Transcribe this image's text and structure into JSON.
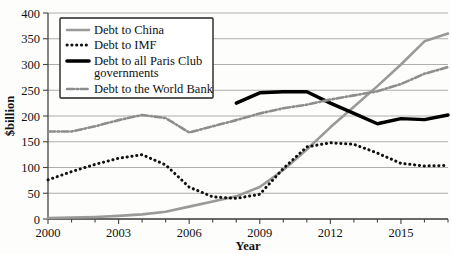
{
  "chart_data": {
    "type": "line",
    "title": "",
    "xlabel": "Year",
    "ylabel": "$billion",
    "xlim": [
      2000,
      2017
    ],
    "ylim": [
      0,
      400
    ],
    "grid": true,
    "legend_position": "top-left",
    "xticks": [
      "2000",
      "2003",
      "2006",
      "2009",
      "2012",
      "2015"
    ],
    "xtick_values": [
      2000,
      2003,
      2006,
      2009,
      2012,
      2015
    ],
    "xminor_values": [
      2001,
      2002,
      2004,
      2005,
      2007,
      2008,
      2010,
      2011,
      2013,
      2014,
      2016,
      2017
    ],
    "yticks": [
      "0",
      "50",
      "100",
      "150",
      "200",
      "250",
      "300",
      "350",
      "400"
    ],
    "ytick_values": [
      0,
      50,
      100,
      150,
      200,
      250,
      300,
      350,
      400
    ],
    "series": [
      {
        "name": "Debt to China",
        "style": "solid",
        "color": "#9a9a9a",
        "width": 2.6,
        "x": [
          2000,
          2001,
          2002,
          2003,
          2004,
          2005,
          2006,
          2007,
          2008,
          2009,
          2010,
          2011,
          2012,
          2013,
          2014,
          2015,
          2016,
          2017
        ],
        "values": [
          2,
          3,
          4,
          6,
          9,
          14,
          24,
          34,
          44,
          62,
          95,
          135,
          178,
          218,
          258,
          300,
          345,
          360
        ]
      },
      {
        "name": "Debt to IMF",
        "style": "dotted",
        "color": "#111111",
        "width": 3.0,
        "x": [
          2000,
          2001,
          2002,
          2003,
          2004,
          2005,
          2006,
          2007,
          2008,
          2009,
          2010,
          2011,
          2012,
          2013,
          2014,
          2015,
          2016,
          2017
        ],
        "values": [
          76,
          92,
          106,
          118,
          125,
          105,
          62,
          43,
          40,
          48,
          98,
          140,
          148,
          145,
          128,
          108,
          103,
          104
        ]
      },
      {
        "name": "Debt to all Paris Club governments",
        "style": "solid",
        "color": "#000000",
        "width": 3.4,
        "x": [
          2008,
          2009,
          2010,
          2011,
          2012,
          2013,
          2014,
          2015,
          2016,
          2017
        ],
        "values": [
          225,
          245,
          247,
          247,
          225,
          205,
          185,
          195,
          193,
          202
        ]
      },
      {
        "name": "Debt to the World Bank",
        "style": "dashdot",
        "color": "#8d8d8d",
        "width": 2.6,
        "x": [
          2000,
          2001,
          2002,
          2003,
          2004,
          2005,
          2006,
          2007,
          2008,
          2009,
          2010,
          2011,
          2012,
          2013,
          2014,
          2015,
          2016,
          2017
        ],
        "values": [
          170,
          170,
          180,
          192,
          202,
          196,
          168,
          180,
          192,
          205,
          215,
          222,
          232,
          240,
          248,
          262,
          282,
          295
        ]
      }
    ]
  },
  "legend": {
    "entries": [
      {
        "label": "Debt to China"
      },
      {
        "label": "Debt to IMF"
      },
      {
        "label": "Debt to all Paris Club"
      },
      {
        "label": "governments"
      },
      {
        "label": "Debt to the World Bank"
      }
    ]
  },
  "axes": {
    "y_title": "$billion",
    "x_title": "Year"
  }
}
